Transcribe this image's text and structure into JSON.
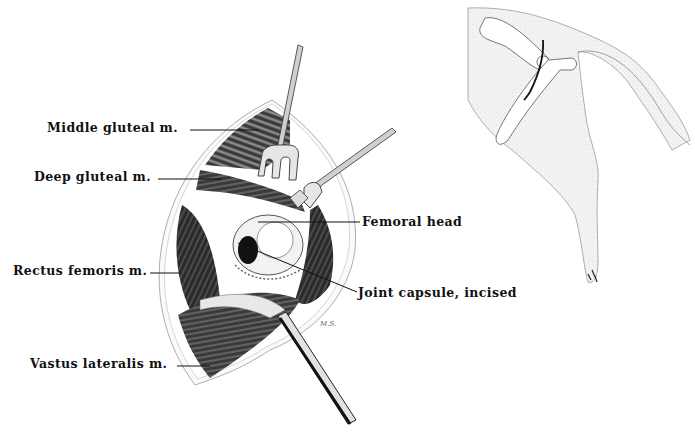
{
  "figure": {
    "type": "surgical-anatomy-illustration",
    "inset": "Dog hindquarter outline with pelvis/femur and incision line"
  },
  "labels": [
    {
      "id": "middle-gluteal",
      "text": "Middle gluteal m.",
      "x": 47,
      "y": 121
    },
    {
      "id": "deep-gluteal",
      "text": "Deep gluteal m.",
      "x": 34,
      "y": 170
    },
    {
      "id": "femoral-head",
      "text": "Femoral head",
      "x": 362,
      "y": 216
    },
    {
      "id": "rectus-femoris",
      "text": "Rectus femoris m.",
      "x": 13,
      "y": 263
    },
    {
      "id": "joint-capsule",
      "text": "Joint capsule, incised",
      "x": 358,
      "y": 287
    },
    {
      "id": "vastus-lateralis",
      "text": "Vastus lateralis m.",
      "x": 30,
      "y": 356
    }
  ],
  "signature": "M.S.",
  "colors": {
    "ink": "#111111",
    "inset_fill": "#ededed",
    "inset_line": "#8a8a8a",
    "incision": "#111111"
  }
}
